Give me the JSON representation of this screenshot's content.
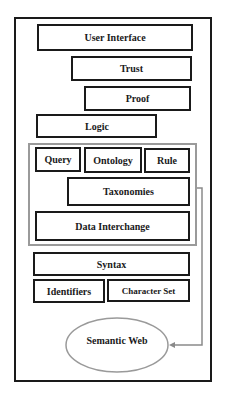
{
  "diagram": {
    "layers": {
      "user_interface": "User Interface",
      "trust": "Trust",
      "proof": "Proof",
      "logic": "Logic",
      "query": "Query",
      "ontology": "Ontology",
      "rule": "Rule",
      "taxonomies": "Taxonomies",
      "data_interchange": "Data Interchange",
      "syntax": "Syntax",
      "identifiers": "Identifiers",
      "character_set": "Character Set"
    },
    "output_node": "Semantic Web",
    "colors": {
      "box_border": "#1a1a1a",
      "group_border": "#9a9a9a",
      "connector": "#8a8a8a",
      "background": "#ffffff"
    }
  }
}
